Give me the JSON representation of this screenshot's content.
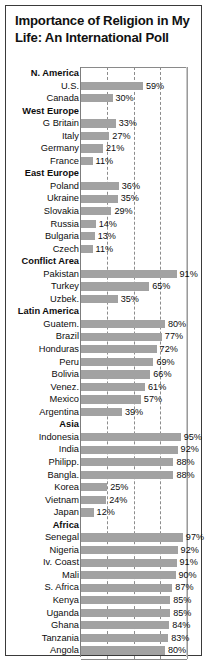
{
  "title": "Importance of Religion in My Life: An International Poll",
  "chart_data": {
    "type": "bar",
    "title": "Importance of Religion in My Life: An International Poll",
    "xlabel": "",
    "ylabel": "",
    "orientation": "horizontal",
    "xlim": [
      0,
      100
    ],
    "value_suffix": "%",
    "grid": true,
    "gridlines": [
      25,
      50,
      75
    ],
    "legend": "none",
    "bar_color": "#a2a2a2",
    "categories": [
      "N. America",
      "U.S.",
      "Canada",
      "West Europe",
      "G Britain",
      "Italy",
      "Germany",
      "France",
      "East Europe",
      "Poland",
      "Ukraine",
      "Slovakia",
      "Russia",
      "Bulgaria",
      "Czech",
      "Conflict Area",
      "Pakistan",
      "Turkey",
      "Uzbek.",
      "Latin America",
      "Guatem.",
      "Brazil",
      "Honduras",
      "Peru",
      "Bolivia",
      "Venez.",
      "Mexico",
      "Argentina",
      "Asia",
      "Indonesia",
      "India",
      "Philipp.",
      "Bangla.",
      "Korea",
      "Vietnam",
      "Japan",
      "Africa",
      "Senegal",
      "Nigeria",
      "Iv. Coast",
      "Mali",
      "S. Africa",
      "Kenya",
      "Uganda",
      "Ghana",
      "Tanzania",
      "Angola"
    ],
    "values": [
      null,
      59,
      30,
      null,
      33,
      27,
      21,
      11,
      null,
      36,
      35,
      29,
      14,
      13,
      11,
      null,
      91,
      65,
      35,
      null,
      80,
      77,
      72,
      69,
      66,
      61,
      57,
      39,
      null,
      95,
      92,
      88,
      88,
      25,
      24,
      12,
      null,
      97,
      92,
      91,
      90,
      87,
      85,
      85,
      84,
      83,
      80
    ],
    "group_headers": [
      "N. America",
      "West Europe",
      "East Europe",
      "Conflict Area",
      "Latin America",
      "Asia",
      "Africa"
    ]
  },
  "rows": [
    {
      "label": "N. America",
      "value": null,
      "value_text": "",
      "header": true
    },
    {
      "label": "U.S.",
      "value": 59,
      "value_text": "59%",
      "header": false
    },
    {
      "label": "Canada",
      "value": 30,
      "value_text": "30%",
      "header": false
    },
    {
      "label": "West Europe",
      "value": null,
      "value_text": "",
      "header": true
    },
    {
      "label": "G Britain",
      "value": 33,
      "value_text": "33%",
      "header": false
    },
    {
      "label": "Italy",
      "value": 27,
      "value_text": "27%",
      "header": false
    },
    {
      "label": "Germany",
      "value": 21,
      "value_text": "21%",
      "header": false
    },
    {
      "label": "France",
      "value": 11,
      "value_text": "11%",
      "header": false
    },
    {
      "label": "East Europe",
      "value": null,
      "value_text": "",
      "header": true
    },
    {
      "label": "Poland",
      "value": 36,
      "value_text": "36%",
      "header": false
    },
    {
      "label": "Ukraine",
      "value": 35,
      "value_text": "35%",
      "header": false
    },
    {
      "label": "Slovakia",
      "value": 29,
      "value_text": "29%",
      "header": false
    },
    {
      "label": "Russia",
      "value": 14,
      "value_text": "14%",
      "header": false
    },
    {
      "label": "Bulgaria",
      "value": 13,
      "value_text": "13%",
      "header": false
    },
    {
      "label": "Czech",
      "value": 11,
      "value_text": "11%",
      "header": false
    },
    {
      "label": "Conflict Area",
      "value": null,
      "value_text": "",
      "header": true
    },
    {
      "label": "Pakistan",
      "value": 91,
      "value_text": "91%",
      "header": false
    },
    {
      "label": "Turkey",
      "value": 65,
      "value_text": "65%",
      "header": false
    },
    {
      "label": "Uzbek.",
      "value": 35,
      "value_text": "35%",
      "header": false
    },
    {
      "label": "Latin America",
      "value": null,
      "value_text": "",
      "header": true
    },
    {
      "label": "Guatem.",
      "value": 80,
      "value_text": "80%",
      "header": false
    },
    {
      "label": "Brazil",
      "value": 77,
      "value_text": "77%",
      "header": false
    },
    {
      "label": "Honduras",
      "value": 72,
      "value_text": "72%",
      "header": false
    },
    {
      "label": "Peru",
      "value": 69,
      "value_text": "69%",
      "header": false
    },
    {
      "label": "Bolivia",
      "value": 66,
      "value_text": "66%",
      "header": false
    },
    {
      "label": "Venez.",
      "value": 61,
      "value_text": "61%",
      "header": false
    },
    {
      "label": "Mexico",
      "value": 57,
      "value_text": "57%",
      "header": false
    },
    {
      "label": "Argentina",
      "value": 39,
      "value_text": "39%",
      "header": false
    },
    {
      "label": "Asia",
      "value": null,
      "value_text": "",
      "header": true
    },
    {
      "label": "Indonesia",
      "value": 95,
      "value_text": "95%",
      "header": false
    },
    {
      "label": "India",
      "value": 92,
      "value_text": "92%",
      "header": false
    },
    {
      "label": "Philipp.",
      "value": 88,
      "value_text": "88%",
      "header": false
    },
    {
      "label": "Bangla.",
      "value": 88,
      "value_text": "88%",
      "header": false
    },
    {
      "label": "Korea",
      "value": 25,
      "value_text": "25%",
      "header": false
    },
    {
      "label": "Vietnam",
      "value": 24,
      "value_text": "24%",
      "header": false
    },
    {
      "label": "Japan",
      "value": 12,
      "value_text": "12%",
      "header": false
    },
    {
      "label": "Africa",
      "value": null,
      "value_text": "",
      "header": true
    },
    {
      "label": "Senegal",
      "value": 97,
      "value_text": "97%",
      "header": false
    },
    {
      "label": "Nigeria",
      "value": 92,
      "value_text": "92%",
      "header": false
    },
    {
      "label": "Iv. Coast",
      "value": 91,
      "value_text": "91%",
      "header": false
    },
    {
      "label": "Mali",
      "value": 90,
      "value_text": "90%",
      "header": false
    },
    {
      "label": "S. Africa",
      "value": 87,
      "value_text": "87%",
      "header": false
    },
    {
      "label": "Kenya",
      "value": 85,
      "value_text": "85%",
      "header": false
    },
    {
      "label": "Uganda",
      "value": 85,
      "value_text": "85%",
      "header": false
    },
    {
      "label": "Ghana",
      "value": 84,
      "value_text": "84%",
      "header": false
    },
    {
      "label": "Tanzania",
      "value": 83,
      "value_text": "83%",
      "header": false
    },
    {
      "label": "Angola",
      "value": 80,
      "value_text": "80%",
      "header": false
    }
  ]
}
